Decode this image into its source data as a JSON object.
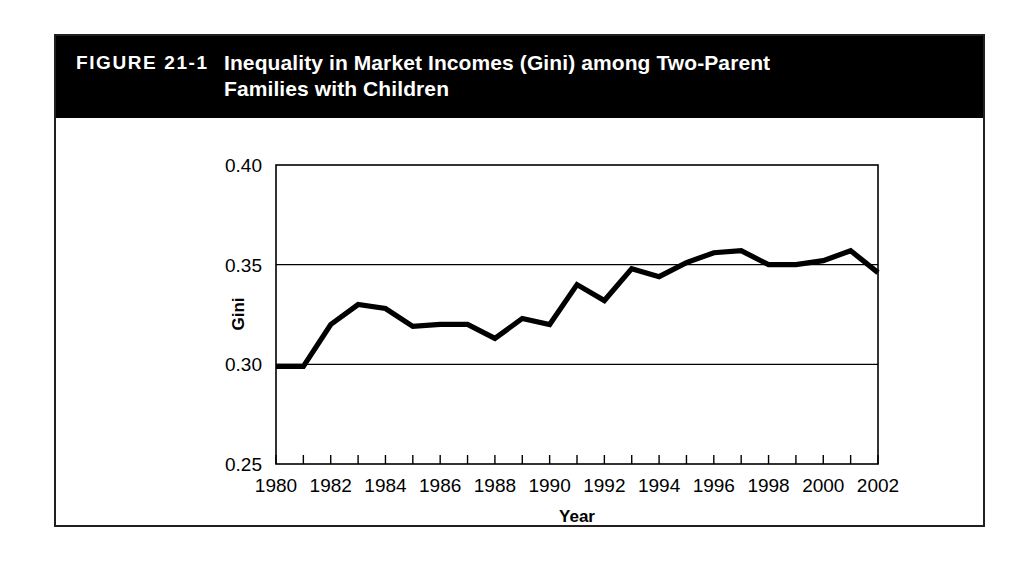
{
  "figure": {
    "number_label": "FIGURE 21-1",
    "title": "Inequality in Market Incomes (Gini) among Two-Parent Families with Children"
  },
  "chart_data": {
    "type": "line",
    "title": "Inequality in Market Incomes (Gini) among Two-Parent Families with Children",
    "xlabel": "Year",
    "ylabel": "Gini",
    "xlim": [
      1980,
      2002
    ],
    "ylim": [
      0.25,
      0.4
    ],
    "ytick_values": [
      0.25,
      0.3,
      0.35,
      0.4
    ],
    "ytick_labels": [
      "0.25",
      "0.30",
      "0.35",
      "0.40"
    ],
    "xtick_values": [
      1980,
      1981,
      1982,
      1983,
      1984,
      1985,
      1986,
      1987,
      1988,
      1989,
      1990,
      1991,
      1992,
      1993,
      1994,
      1995,
      1996,
      1997,
      1998,
      1999,
      2000,
      2001,
      2002
    ],
    "xtick_labels": [
      "1980",
      "",
      "1982",
      "",
      "1984",
      "",
      "1986",
      "",
      "1988",
      "",
      "1990",
      "",
      "1992",
      "",
      "1994",
      "",
      "1996",
      "",
      "1998",
      "",
      "2000",
      "",
      "2002"
    ],
    "grid": "horizontal-at-0.30-and-0.35",
    "legend": "none",
    "line_color": "#000000",
    "x": [
      1980,
      1981,
      1982,
      1983,
      1984,
      1985,
      1986,
      1987,
      1988,
      1989,
      1990,
      1991,
      1992,
      1993,
      1994,
      1995,
      1996,
      1997,
      1998,
      1999,
      2000,
      2001,
      2002
    ],
    "values": [
      0.299,
      0.299,
      0.32,
      0.33,
      0.328,
      0.319,
      0.32,
      0.32,
      0.313,
      0.323,
      0.32,
      0.34,
      0.332,
      0.348,
      0.344,
      0.351,
      0.356,
      0.357,
      0.35,
      0.35,
      0.352,
      0.357,
      0.346
    ],
    "series": [
      {
        "name": "Gini",
        "values": [
          0.299,
          0.299,
          0.32,
          0.33,
          0.328,
          0.319,
          0.32,
          0.32,
          0.313,
          0.323,
          0.32,
          0.34,
          0.332,
          0.348,
          0.344,
          0.351,
          0.356,
          0.357,
          0.35,
          0.35,
          0.352,
          0.357,
          0.346
        ]
      }
    ]
  }
}
